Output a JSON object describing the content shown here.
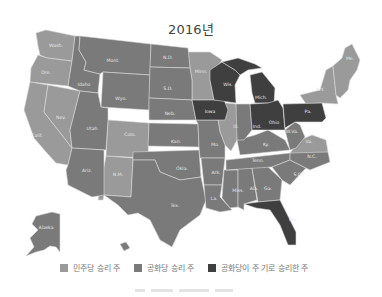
{
  "title": "2016년",
  "colors": {
    "democrat": "#9a9a9a",
    "republican": "#7a7a7a",
    "flipped_republican": "#3f3f3f",
    "border": "#d8d8d8",
    "background": "#ffffff"
  },
  "legend": [
    {
      "label": "민주당 승리 주",
      "color": "#9a9a9a"
    },
    {
      "label": "공화당 승리 주",
      "color": "#7a7a7a"
    },
    {
      "label": "공화당이 주 기로 승리한 주",
      "color": "#3f3f3f"
    }
  ],
  "states": {
    "wash": "Wash.",
    "ore": "Ore.",
    "calif": "Calif.",
    "nev": "Nev.",
    "idaho": "Idaho",
    "mont": "Mont.",
    "wyo": "Wyo.",
    "utah": "Utah",
    "colo": "Colo.",
    "ariz": "Ariz.",
    "nm": "N.M.",
    "nd": "N.D.",
    "sd": "S.D.",
    "neb": "Neb.",
    "kan": "Kan.",
    "okla": "Okla.",
    "tex": "Tex.",
    "minn": "Minn.",
    "iowa": "Iowa",
    "mo": "Mo.",
    "ark": "Ark.",
    "la": "La.",
    "wis": "Wis.",
    "ill": "Ill.",
    "mich": "Mich.",
    "ind": "Ind.",
    "ohio": "Ohio",
    "ky": "Ky.",
    "tenn": "Tenn.",
    "miss": "Miss.",
    "ala": "Ala.",
    "ga": "Ga.",
    "fla": "Fla.",
    "sc": "S.C.",
    "nc": "N.C.",
    "va": "Va.",
    "wva": "W.Va.",
    "pa": "Pa.",
    "ny": "N.Y.",
    "me": "Me.",
    "alaska": "Alaska"
  }
}
